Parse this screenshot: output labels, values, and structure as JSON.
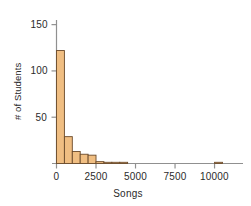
{
  "chart_data": {
    "type": "bar",
    "title": "",
    "subtitle": "",
    "xlabel": "Songs",
    "ylabel": "# of Students",
    "xlim": [
      0,
      11800
    ],
    "ylim": [
      0,
      155
    ],
    "xticks": [
      0,
      2500,
      5000,
      7500,
      10000
    ],
    "xtick_labels": [
      "0",
      "2500",
      "5000",
      "7500",
      "10000"
    ],
    "yticks": [
      50,
      100,
      150
    ],
    "ytick_labels": [
      "50",
      "100",
      "150"
    ],
    "grid": false,
    "legend": null,
    "bin_width": 500,
    "bin_starts": [
      0,
      500,
      1000,
      1500,
      2000,
      2500,
      3000,
      3500,
      4000,
      10000
    ],
    "categories": [
      "0-500",
      "500-1000",
      "1000-1500",
      "1500-2000",
      "2000-2500",
      "2500-3000",
      "3000-3500",
      "3500-4000",
      "4000-4500",
      "10000-10500"
    ],
    "values": [
      122,
      29,
      13,
      10,
      9,
      2,
      1,
      1,
      1,
      1
    ],
    "bar_fill_color": "#f0be82",
    "bar_edge_color": "#6b4a2a",
    "axis_color": "#808080",
    "text_color": "#2b2b2b"
  },
  "axes": {
    "x_axis_name": "Songs",
    "y_axis_name": "# of Students"
  }
}
